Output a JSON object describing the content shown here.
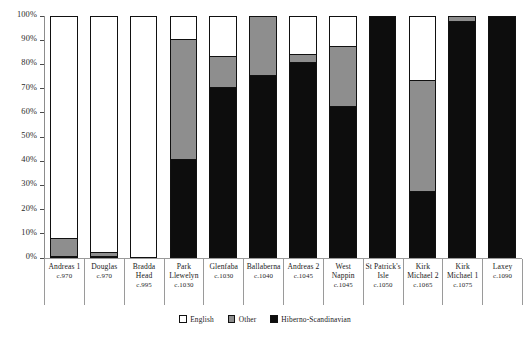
{
  "chart_data": {
    "type": "bar",
    "subtype": "stacked-percentage",
    "title": "",
    "xlabel": "",
    "ylabel": "",
    "ylim": [
      0,
      100
    ],
    "grid": false,
    "legend_position": "bottom",
    "categories": [
      "Andreas 1",
      "Douglas",
      "Bradda Head",
      "Park Llewelyn",
      "Glenfaba",
      "Ballaberna",
      "Andreas 2",
      "West Nappin",
      "St Patrick's Isle",
      "Kirk Michael 2",
      "Kirk Michael 1",
      "Laxey"
    ],
    "category_dates": [
      "c.970",
      "c.970",
      "c.995",
      "c.1030",
      "c.1030",
      "c.1040",
      "c.1045",
      "c.1045",
      "c.1050",
      "c.1065",
      "c.1075",
      "c.1090"
    ],
    "ytick_labels": [
      "0%",
      "10%",
      "20%",
      "30%",
      "40%",
      "50%",
      "60%",
      "70%",
      "80%",
      "90%",
      "100%"
    ],
    "ytick_values": [
      0,
      10,
      20,
      30,
      40,
      50,
      60,
      70,
      80,
      90,
      100
    ],
    "series": [
      {
        "name": "English",
        "color": "#ffffff",
        "values": [
          92,
          98,
          100,
          10,
          17,
          0,
          16,
          13,
          0,
          27,
          0,
          0
        ]
      },
      {
        "name": "Other",
        "color": "#8e8e8e",
        "values": [
          8,
          2,
          0,
          50,
          13,
          25,
          4,
          25,
          0,
          46,
          3,
          0
        ]
      },
      {
        "name": "Hiberno-Scandinavian",
        "color": "#0d0d0d",
        "values": [
          0,
          0,
          0,
          40,
          70,
          75,
          80,
          62,
          100,
          27,
          97,
          100
        ]
      }
    ]
  },
  "legend": {
    "items": [
      {
        "label": "English",
        "color": "#ffffff"
      },
      {
        "label": "Other",
        "color": "#8e8e8e"
      },
      {
        "label": "Hiberno-Scandinavian",
        "color": "#0d0d0d"
      }
    ]
  }
}
